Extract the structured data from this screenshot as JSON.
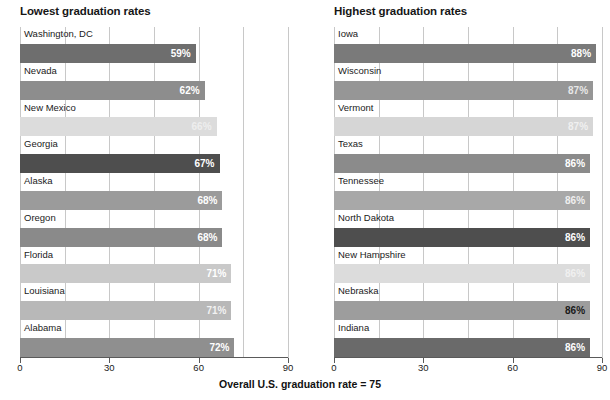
{
  "footer": {
    "note": "Overall U.S. graduation rate = 75"
  },
  "axis": {
    "ticks": [
      0,
      30,
      60,
      90
    ],
    "tick_labels": [
      "0",
      "30",
      "60",
      "90"
    ],
    "min": 0,
    "max": 90
  },
  "panels": [
    {
      "id": "lowest",
      "title": "Lowest graduation rates"
    },
    {
      "id": "highest",
      "title": "Highest graduation rates"
    }
  ],
  "chart_data": [
    {
      "type": "bar",
      "orientation": "horizontal",
      "title": "Lowest graduation rates",
      "xlabel": "",
      "ylabel": "",
      "xlim": [
        0,
        90
      ],
      "grid": true,
      "gridlines": [
        0,
        15,
        30,
        45,
        60,
        75,
        90
      ],
      "categories": [
        "Washington, DC",
        "Nevada",
        "New Mexico",
        "Georgia",
        "Alaska",
        "Oregon",
        "Florida",
        "Louisiana",
        "Alabama"
      ],
      "values": [
        59,
        62,
        66,
        67,
        68,
        68,
        71,
        71,
        72
      ],
      "value_labels": [
        "59%",
        "62%",
        "66%",
        "67%",
        "68%",
        "68%",
        "71%",
        "71%",
        "72%"
      ],
      "bar_colors": [
        "#6e6e6e",
        "#8d8d8d",
        "#dcdcdc",
        "#4e4e4e",
        "#9b9b9b",
        "#8a8a8a",
        "#c9c9c9",
        "#b8b8b8",
        "#8f8f8f"
      ],
      "value_label_colors": [
        "#ffffff",
        "#ffffff",
        "#eeeeee",
        "#ffffff",
        "#ffffff",
        "#ffffff",
        "#ffffff",
        "#f2f2f2",
        "#ffffff"
      ]
    },
    {
      "type": "bar",
      "orientation": "horizontal",
      "title": "Highest graduation rates",
      "xlabel": "",
      "ylabel": "",
      "xlim": [
        0,
        90
      ],
      "grid": true,
      "gridlines": [
        0,
        15,
        30,
        45,
        60,
        75,
        90
      ],
      "categories": [
        "Iowa",
        "Wisconsin",
        "Vermont",
        "Texas",
        "Tennessee",
        "North Dakota",
        "New Hampshire",
        "Nebraska",
        "Indiana"
      ],
      "values": [
        88,
        87,
        87,
        86,
        86,
        86,
        86,
        86,
        86
      ],
      "value_labels": [
        "88%",
        "87%",
        "87%",
        "86%",
        "86%",
        "86%",
        "86%",
        "86%",
        "86%"
      ],
      "bar_colors": [
        "#7a7a7a",
        "#969696",
        "#d6d6d6",
        "#8b8b8b",
        "#a8a8a8",
        "#4e4e4e",
        "#dcdcdc",
        "#9d9d9d",
        "#6a6a6a"
      ],
      "value_label_colors": [
        "#ffffff",
        "#e8e8e8",
        "#f0f0f0",
        "#ffffff",
        "#efefef",
        "#ffffff",
        "#f0f0f0",
        "#1a1a1a",
        "#ffffff"
      ]
    }
  ],
  "colors": {
    "grid": "#c8c8c8",
    "axis": "#5a5a5a",
    "text": "#1a1a1a"
  }
}
